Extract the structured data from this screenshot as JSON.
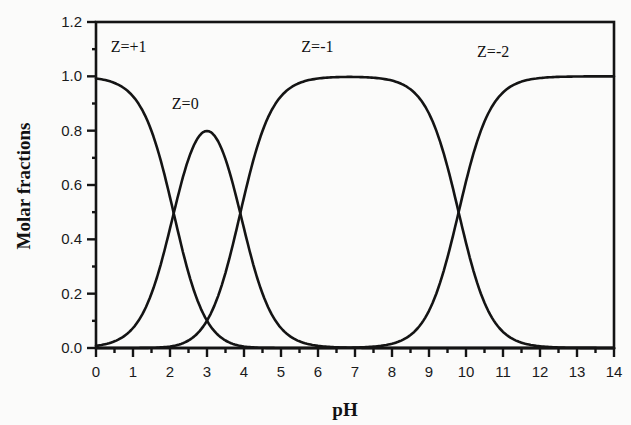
{
  "chart_data": {
    "type": "line",
    "title": "",
    "xlabel": "pH",
    "ylabel": "Molar fractions",
    "xlim": [
      0,
      14
    ],
    "ylim": [
      0,
      1.2
    ],
    "grid": false,
    "legend": "none (inline curve labels)",
    "x_ticks": [
      "0",
      "1",
      "2",
      "3",
      "4",
      "5",
      "6",
      "7",
      "8",
      "9",
      "10",
      "11",
      "12",
      "13",
      "14"
    ],
    "y_ticks": [
      "0.0",
      "0.2",
      "0.4",
      "0.6",
      "0.8",
      "1.0",
      "1.2"
    ],
    "x_minor_step": 0.5,
    "y_minor_step": 0.1,
    "pKa": [
      2.1,
      3.9,
      9.8
    ],
    "x": [
      0,
      0.5,
      1,
      1.5,
      2,
      2.5,
      3,
      3.5,
      4,
      4.5,
      5,
      5.5,
      6,
      6.5,
      7,
      7.5,
      8,
      8.5,
      9,
      9.5,
      10,
      10.5,
      11,
      11.5,
      12,
      12.5,
      13,
      13.5,
      14
    ],
    "series": [
      {
        "name": "Z=+1",
        "values": [
          0.99,
          0.98,
          0.93,
          0.79,
          0.55,
          0.28,
          0.1,
          0.03,
          0.01,
          0.0,
          0.0,
          0.0,
          0.0,
          0.0,
          0.0,
          0.0,
          0.0,
          0.0,
          0.0,
          0.0,
          0.0,
          0.0,
          0.0,
          0.0,
          0.0,
          0.0,
          0.0,
          0.0,
          0.0
        ]
      },
      {
        "name": "Z=0",
        "values": [
          0.01,
          0.02,
          0.07,
          0.2,
          0.44,
          0.7,
          0.8,
          0.69,
          0.44,
          0.2,
          0.07,
          0.02,
          0.01,
          0.0,
          0.0,
          0.0,
          0.0,
          0.0,
          0.0,
          0.0,
          0.0,
          0.0,
          0.0,
          0.0,
          0.0,
          0.0,
          0.0,
          0.0,
          0.0
        ]
      },
      {
        "name": "Z=-1",
        "values": [
          0.0,
          0.0,
          0.0,
          0.01,
          0.01,
          0.02,
          0.1,
          0.28,
          0.56,
          0.8,
          0.93,
          0.98,
          0.99,
          1.0,
          1.0,
          1.0,
          0.98,
          0.94,
          0.86,
          0.67,
          0.39,
          0.17,
          0.06,
          0.02,
          0.01,
          0.0,
          0.0,
          0.0,
          0.0
        ]
      },
      {
        "name": "Z=-2",
        "values": [
          0.0,
          0.0,
          0.0,
          0.0,
          0.0,
          0.0,
          0.0,
          0.0,
          0.0,
          0.0,
          0.0,
          0.0,
          0.0,
          0.0,
          0.0,
          0.0,
          0.02,
          0.06,
          0.14,
          0.33,
          0.61,
          0.83,
          0.94,
          0.98,
          1.0,
          1.0,
          1.0,
          1.0,
          1.0
        ]
      }
    ],
    "annotations": [
      {
        "text": "Z=+1",
        "x": 0.4,
        "y": 1.09
      },
      {
        "text": "Z=0",
        "x": 2.05,
        "y": 0.88
      },
      {
        "text": "Z=-1",
        "x": 5.55,
        "y": 1.09
      },
      {
        "text": "Z=-2",
        "x": 10.3,
        "y": 1.07
      }
    ]
  },
  "labels": {
    "xlabel": "pH",
    "ylabel": "Molar fractions",
    "z_plus1": "Z=+1",
    "z_0": "Z=0",
    "z_minus1": "Z=-1",
    "z_minus2": "Z=-2"
  }
}
